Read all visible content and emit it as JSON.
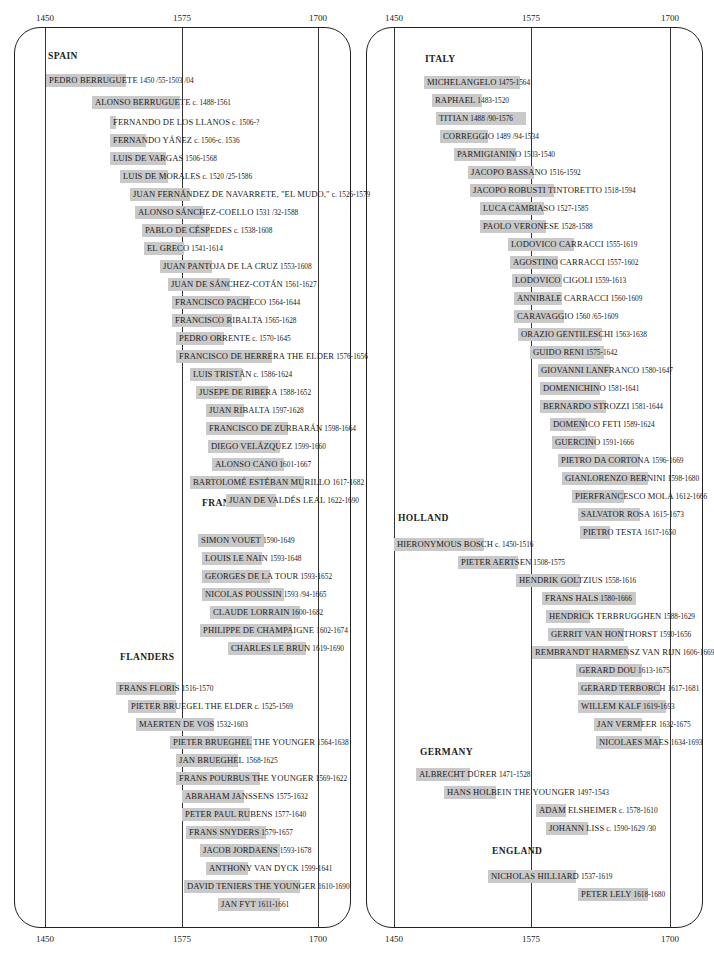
{
  "title_fragment": "…ology of … Baroque Painters (cropped)",
  "axis": {
    "ticks": [
      "1450",
      "1575",
      "1700"
    ]
  },
  "chart_data": {
    "type": "timeline",
    "title": "",
    "xlabel": "Year",
    "xlim": [
      1450,
      1700
    ],
    "xticks": [
      1450,
      1575,
      1700
    ],
    "gridlines": [
      1450,
      1575,
      1700
    ],
    "panels": [
      {
        "sections": [
          {
            "name": "SPAIN",
            "artists": [
              {
                "name": "PEDRO BERRUGUETE",
                "dates": "1450 /55-1503 /04"
              },
              {
                "name": "ALONSO BERRUGUETE",
                "dates": "c. 1488-1561"
              },
              {
                "name": "FERNANDO DE LOS LLANOS",
                "dates": "c. 1506-?"
              },
              {
                "name": "FERNANDO YÁÑEZ",
                "dates": "c. 1506-c. 1536"
              },
              {
                "name": "LUIS DE VARGAS",
                "dates": "1506-1568"
              },
              {
                "name": "LUIS DE MORALES",
                "dates": "c. 1520 /25-1586"
              },
              {
                "name": "JUAN FERNÁNDEZ DE NAVARRETE, \"EL MUDO,\"",
                "dates": "c. 1526-1579"
              },
              {
                "name": "ALONSO SÁNCHEZ-COELLO",
                "dates": "1531 /32-1588"
              },
              {
                "name": "PABLO DE CÉSPEDES",
                "dates": "c. 1538-1608"
              },
              {
                "name": "EL GRECO",
                "dates": "1541-1614"
              },
              {
                "name": "JUAN PANTOJA DE LA CRUZ",
                "dates": "1553-1608"
              },
              {
                "name": "JUAN DE SÁNCHEZ-COTÁN",
                "dates": "1561-1627"
              },
              {
                "name": "FRANCISCO PACHECO",
                "dates": "1564-1644"
              },
              {
                "name": "FRANCISCO RIBALTA",
                "dates": "1565-1628"
              },
              {
                "name": "PEDRO ORRENTE",
                "dates": "c. 1570-1645"
              },
              {
                "name": "FRANCISCO DE HERRERA THE ELDER",
                "dates": "1576-1656"
              },
              {
                "name": "LUIS TRISTÁN",
                "dates": "c. 1586-1624"
              },
              {
                "name": "JUSEPE DE RIBERA",
                "dates": "1588-1652"
              },
              {
                "name": "JUAN RIBALTA",
                "dates": "1597-1628"
              },
              {
                "name": "FRANCISCO DE ZURBARÁN",
                "dates": "1598-1664"
              },
              {
                "name": "DIEGO VELÁZQUEZ",
                "dates": "1599-1660"
              },
              {
                "name": "ALONSO CANO",
                "dates": "1601-1667"
              },
              {
                "name": "BARTOLOMÉ ESTÉBAN MURILLO",
                "dates": "1617-1682"
              },
              {
                "name": "JUAN DE VALDÉS LEAL",
                "dates": "1622-1690"
              }
            ]
          },
          {
            "name": "FRANCE",
            "artists": [
              {
                "name": "SIMON VOUET",
                "dates": "1590-1649"
              },
              {
                "name": "LOUIS LE NAIN",
                "dates": "1593-1648"
              },
              {
                "name": "GEORGES DE LA TOUR",
                "dates": "1593-1652"
              },
              {
                "name": "NICOLAS POUSSIN",
                "dates": "1593 /94-1665"
              },
              {
                "name": "CLAUDE LORRAIN",
                "dates": "1600-1682"
              },
              {
                "name": "PHILIPPE DE CHAMPAIGNE",
                "dates": "1602-1674"
              },
              {
                "name": "CHARLES LE BRUN",
                "dates": "1619-1690"
              }
            ]
          },
          {
            "name": "FLANDERS",
            "artists": [
              {
                "name": "FRANS FLORIS",
                "dates": "1516-1570"
              },
              {
                "name": "PIETER BRUEGEL THE ELDER",
                "dates": "c. 1525-1569"
              },
              {
                "name": "MAERTEN DE VOS",
                "dates": "1532-1603"
              },
              {
                "name": "PIETER BRUEGHEL THE YOUNGER",
                "dates": "1564-1638"
              },
              {
                "name": "JAN BRUEGHEL",
                "dates": "1568-1625"
              },
              {
                "name": "FRANS POURBUS THE YOUNGER",
                "dates": "1569-1622"
              },
              {
                "name": "ABRAHAM JANSSENS",
                "dates": "1575-1632"
              },
              {
                "name": "PETER PAUL RUBENS",
                "dates": "1577-1640"
              },
              {
                "name": "FRANS SNYDERS",
                "dates": "1579-1657"
              },
              {
                "name": "JACOB JORDAENS",
                "dates": "1593-1678"
              },
              {
                "name": "ANTHONY VAN DYCK",
                "dates": "1599-1641"
              },
              {
                "name": "DAVID TENIERS THE YOUNGER",
                "dates": "1610-1690"
              },
              {
                "name": "JAN FYT",
                "dates": "1611-1661"
              }
            ]
          }
        ]
      },
      {
        "sections": [
          {
            "name": "ITALY",
            "artists": [
              {
                "name": "MICHELANGELO",
                "dates": "1475-1564"
              },
              {
                "name": "RAPHAEL",
                "dates": "1483-1520"
              },
              {
                "name": "TITIAN",
                "dates": "1488 /90-1576"
              },
              {
                "name": "CORREGGIO",
                "dates": "1489 /94-1534"
              },
              {
                "name": "PARMIGIANINO",
                "dates": "1503-1540"
              },
              {
                "name": "JACOPO BASSANO",
                "dates": "1516-1592"
              },
              {
                "name": "JACOPO ROBUSTI TINTORETTO",
                "dates": "1518-1594"
              },
              {
                "name": "LUCA CAMBIASO",
                "dates": "1527-1585"
              },
              {
                "name": "PAOLO VERONESE",
                "dates": "1528-1588"
              },
              {
                "name": "LODOVICO CARRACCI",
                "dates": "1555-1619"
              },
              {
                "name": "AGOSTINO CARRACCI",
                "dates": "1557-1602"
              },
              {
                "name": "LODOVICO CIGOLI",
                "dates": "1559-1613"
              },
              {
                "name": "ANNIBALE CARRACCI",
                "dates": "1560-1609"
              },
              {
                "name": "CARAVAGGIO",
                "dates": "1560 /65-1609"
              },
              {
                "name": "ORAZIO GENTILESCHI",
                "dates": "1563-1638"
              },
              {
                "name": "GUIDO RENI",
                "dates": "1575-1642"
              },
              {
                "name": "GIOVANNI LANFRANCO",
                "dates": "1580-1647"
              },
              {
                "name": "DOMENICHINO",
                "dates": "1581-1641"
              },
              {
                "name": "BERNARDO STROZZI",
                "dates": "1581-1644"
              },
              {
                "name": "DOMENICO FETI",
                "dates": "1589-1624"
              },
              {
                "name": "GUERCINO",
                "dates": "1591-1666"
              },
              {
                "name": "PIETRO DA CORTONA",
                "dates": "1596-1669"
              },
              {
                "name": "GIANLORENZO BERNINI",
                "dates": "1598-1680"
              },
              {
                "name": "PIERFRANCESCO MOLA",
                "dates": "1612-1666"
              },
              {
                "name": "SALVATOR ROSA",
                "dates": "1615-1673"
              },
              {
                "name": "PIETRO TESTA",
                "dates": "1617-1650"
              }
            ]
          },
          {
            "name": "HOLLAND",
            "artists": [
              {
                "name": "HIERONYMOUS BOSCH",
                "dates": "c. 1450-1516"
              },
              {
                "name": "PIETER AERTSEN",
                "dates": "1508-1575"
              },
              {
                "name": "HENDRIK GOLTZIUS",
                "dates": "1558-1616"
              },
              {
                "name": "FRANS HALS",
                "dates": "1580-1666"
              },
              {
                "name": "HENDRICK TERBRUGGHEN",
                "dates": "1588-1629"
              },
              {
                "name": "GERRIT VAN HONTHORST",
                "dates": "1590-1656"
              },
              {
                "name": "REMBRANDT HARMENSZ VAN RIJN",
                "dates": "1606-1669"
              },
              {
                "name": "GERARD DOU",
                "dates": "1613-1675"
              },
              {
                "name": "GERARD TERBORCH",
                "dates": "1617-1681"
              },
              {
                "name": "WILLEM KALF",
                "dates": "1619-1693"
              },
              {
                "name": "JAN VERMEER",
                "dates": "1632-1675"
              },
              {
                "name": "NICOLAES MAES",
                "dates": "1634-1693"
              }
            ]
          },
          {
            "name": "GERMANY",
            "artists": [
              {
                "name": "ALBRECHT DÜRER",
                "dates": "1471-1528"
              },
              {
                "name": "HANS HOLBEIN THE YOUNGER",
                "dates": "1497-1543"
              },
              {
                "name": "ADAM ELSHEIMER",
                "dates": "c. 1578-1610"
              },
              {
                "name": "JOHANN LISS",
                "dates": "c. 1590-1629 /30"
              }
            ]
          },
          {
            "name": "ENGLAND",
            "artists": [
              {
                "name": "NICHOLAS HILLIARD",
                "dates": "1537-1619"
              },
              {
                "name": "PETER LELY",
                "dates": "1618-1680"
              }
            ]
          }
        ]
      }
    ]
  },
  "colors": {
    "bar": "#c9c9c9",
    "line": "#333333",
    "text": "#1a1a1a"
  },
  "layout": {
    "left": {
      "x1450": 45,
      "x1575": 182,
      "x1700": 318
    },
    "right": {
      "x1450": 394,
      "x1575": 531,
      "x1700": 670
    },
    "sections_y": {
      "SPAIN": 56,
      "FRANCE": 498,
      "FLANDERS": 655,
      "ITALY": 58,
      "HOLLAND": 518,
      "GERMANY": 748,
      "ENGLAND": 846
    },
    "rows": {
      "p0s0": [
        [
          46,
          74,
          80
        ],
        [
          92,
          96,
          88
        ],
        [
          110,
          116,
          6
        ],
        [
          110,
          134,
          36
        ],
        [
          110,
          152,
          56
        ],
        [
          120,
          170,
          48
        ],
        [
          130,
          188,
          60
        ],
        [
          135,
          206,
          68
        ],
        [
          142,
          224,
          68
        ],
        [
          144,
          242,
          40
        ],
        [
          160,
          260,
          52
        ],
        [
          168,
          278,
          62
        ],
        [
          172,
          296,
          78
        ],
        [
          172,
          314,
          60
        ],
        [
          176,
          332,
          48
        ],
        [
          176,
          350,
          96
        ],
        [
          190,
          368,
          52
        ],
        [
          196,
          386,
          72
        ],
        [
          206,
          404,
          38
        ],
        [
          206,
          422,
          82
        ],
        [
          208,
          440,
          72
        ],
        [
          212,
          458,
          72
        ],
        [
          190,
          476,
          114
        ],
        [
          226,
          494,
          50
        ]
      ],
      "p0s1": [
        [
          198,
          534,
          66
        ],
        [
          202,
          552,
          60
        ],
        [
          202,
          570,
          68
        ],
        [
          202,
          588,
          82
        ],
        [
          210,
          606,
          90
        ],
        [
          200,
          624,
          92
        ],
        [
          228,
          642,
          78
        ]
      ],
      "p0s2": [
        [
          116,
          682,
          60
        ],
        [
          128,
          700,
          48
        ],
        [
          136,
          718,
          78
        ],
        [
          170,
          736,
          82
        ],
        [
          176,
          754,
          62
        ],
        [
          176,
          772,
          84
        ],
        [
          182,
          790,
          62
        ],
        [
          182,
          808,
          68
        ],
        [
          186,
          826,
          80
        ],
        [
          200,
          844,
          80
        ],
        [
          206,
          862,
          42
        ],
        [
          184,
          880,
          116
        ],
        [
          218,
          898,
          62
        ]
      ]
    }
  }
}
